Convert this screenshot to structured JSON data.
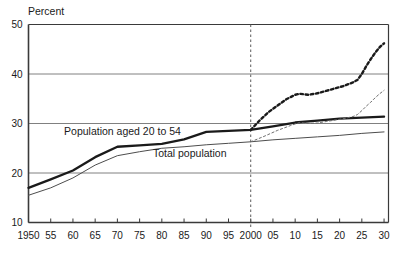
{
  "chart_data": {
    "type": "line",
    "title": "",
    "subtitle": "",
    "ylabel": "Percent",
    "xlabel": "",
    "ylim": [
      10,
      50
    ],
    "xlim": [
      1950,
      2031
    ],
    "grid": "horizontal",
    "gridline_values": [
      20,
      30,
      40
    ],
    "y_ticks": [
      "10",
      "20",
      "30",
      "40",
      "50"
    ],
    "y_tick_values": [
      10,
      20,
      30,
      40,
      50
    ],
    "x_ticks": [
      "1950",
      "55",
      "60",
      "65",
      "70",
      "75",
      "80",
      "85",
      "90",
      "95",
      "2000",
      "05",
      "10",
      "15",
      "20",
      "25",
      "30"
    ],
    "x_tick_values": [
      1950,
      1955,
      1960,
      1965,
      1970,
      1975,
      1980,
      1985,
      1990,
      1995,
      2000,
      2005,
      2010,
      2015,
      2020,
      2025,
      2030
    ],
    "legend": "inline-annotations",
    "annotations": [
      {
        "text": "Population aged 20 to 54",
        "x": 1958,
        "y": 27.6
      },
      {
        "text": "Total population",
        "x": 1978,
        "y": 23.2
      }
    ],
    "divider": {
      "type": "vertical-dashed",
      "x": 2000,
      "label": "projection-start"
    },
    "series": [
      {
        "name": "Population aged 20 to 54",
        "style": "solid",
        "weight": "bold",
        "color": "#1a1a1a",
        "x": [
          1950,
          1955,
          1960,
          1965,
          1970,
          1975,
          1980,
          1985,
          1990,
          1995,
          2000,
          2005,
          2010,
          2015,
          2020,
          2025,
          2030
        ],
        "values": [
          17.0,
          18.7,
          20.5,
          23.2,
          25.3,
          25.6,
          25.9,
          26.8,
          28.3,
          28.5,
          28.7,
          29.4,
          30.2,
          30.6,
          31.0,
          31.2,
          31.4
        ]
      },
      {
        "name": "Total population",
        "style": "solid",
        "weight": "thin",
        "color": "#4d4d4d",
        "x": [
          1950,
          1955,
          1960,
          1965,
          1970,
          1975,
          1980,
          1985,
          1990,
          1995,
          2000,
          2005,
          2010,
          2015,
          2020,
          2025,
          2030
        ],
        "values": [
          15.5,
          17.0,
          19.0,
          21.6,
          23.5,
          24.3,
          25.0,
          25.3,
          25.7,
          26.0,
          26.3,
          26.7,
          27.0,
          27.3,
          27.6,
          28.0,
          28.3
        ]
      },
      {
        "name": "Population aged 20 to 54 (projection)",
        "style": "dashed",
        "weight": "bold",
        "color": "#1a1a1a",
        "x": [
          2000,
          2002,
          2004,
          2006,
          2008,
          2010,
          2011,
          2013,
          2015,
          2017,
          2019,
          2021,
          2023,
          2024,
          2025,
          2026,
          2027,
          2028,
          2029,
          2030
        ],
        "values": [
          28.7,
          30.6,
          32.3,
          33.6,
          34.9,
          35.8,
          36.0,
          35.8,
          36.1,
          36.6,
          37.1,
          37.6,
          38.3,
          38.8,
          40.0,
          41.6,
          43.0,
          44.3,
          45.4,
          46.2
        ]
      },
      {
        "name": "Total population (projection)",
        "style": "dashed",
        "weight": "thin",
        "color": "#6e6e6e",
        "x": [
          2000,
          2003,
          2006,
          2009,
          2011,
          2013,
          2015,
          2017,
          2019,
          2021,
          2023,
          2024,
          2025,
          2026,
          2027,
          2028,
          2029,
          2030
        ],
        "values": [
          26.3,
          27.4,
          28.6,
          29.6,
          30.2,
          30.0,
          30.1,
          30.4,
          30.7,
          31.0,
          31.4,
          31.8,
          32.6,
          33.5,
          34.3,
          35.2,
          36.0,
          36.7
        ]
      }
    ]
  }
}
